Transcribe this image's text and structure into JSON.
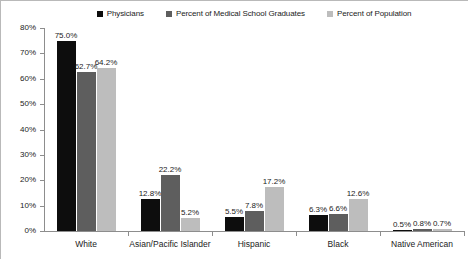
{
  "chart_data": {
    "type": "bar",
    "title": "",
    "xlabel": "",
    "ylabel": "",
    "ylim": [
      0,
      80
    ],
    "grid": false,
    "legend_position": "top-center",
    "categories": [
      "White",
      "Asian/Pacific Islander",
      "Hispanic",
      "Black",
      "Native American"
    ],
    "ytick_labels": [
      "0%",
      "10%",
      "20%",
      "30%",
      "40%",
      "50%",
      "60%",
      "70%",
      "80%"
    ],
    "ytick_values": [
      0,
      10,
      20,
      30,
      40,
      50,
      60,
      70,
      80
    ],
    "series": [
      {
        "name": "Physicians",
        "color": "#0d0d0d",
        "values": [
          75.0,
          12.8,
          5.5,
          6.3,
          0.5
        ],
        "labels": [
          "75.0%",
          "12.8%",
          "5.5%",
          "6.3%",
          "0.5%"
        ]
      },
      {
        "name": "Percent of Medical School Graduates",
        "color": "#5e5e5e",
        "values": [
          62.7,
          22.2,
          7.8,
          6.6,
          0.8
        ],
        "labels": [
          "62.7%",
          "22.2%",
          "7.8%",
          "6.6%",
          "0.8%"
        ]
      },
      {
        "name": "Percent of Population",
        "color": "#bdbdbd",
        "values": [
          64.2,
          5.2,
          17.2,
          12.6,
          0.7
        ],
        "labels": [
          "64.2%",
          "5.2%",
          "17.2%",
          "12.6%",
          "0.7%"
        ]
      }
    ]
  },
  "legend": {
    "items": [
      {
        "label": "Physicians",
        "marker": "square-marker",
        "color": "#0d0d0d"
      },
      {
        "label": "Percent of Medical School Graduates",
        "marker": "square-marker",
        "color": "#5e5e5e"
      },
      {
        "label": "Percent of Population",
        "marker": "square-marker",
        "color": "#bdbdbd"
      }
    ]
  },
  "axis": {
    "y_labels": [
      "80%",
      "70%",
      "60%",
      "50%",
      "40%",
      "30%",
      "20%",
      "10%",
      "0%"
    ]
  }
}
